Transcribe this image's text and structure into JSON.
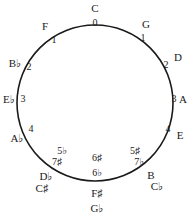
{
  "diagram": {
    "circle": {
      "cx": 95,
      "cy": 103,
      "r": 78,
      "stroke": "#1a1a1a",
      "stroke_width": 1.6
    },
    "keys": [
      {
        "id": "c",
        "label": "C",
        "x": 95,
        "y": 8
      },
      {
        "id": "g",
        "label": "G",
        "x": 146,
        "y": 24
      },
      {
        "id": "d",
        "label": "D",
        "x": 178,
        "y": 57
      },
      {
        "id": "a",
        "label": "A",
        "x": 183,
        "y": 99
      },
      {
        "id": "e",
        "label": "E",
        "x": 180,
        "y": 135
      },
      {
        "id": "b",
        "label": "B",
        "x": 151,
        "y": 175
      },
      {
        "id": "cb",
        "label": "C♭",
        "x": 157,
        "y": 186
      },
      {
        "id": "fs",
        "label": "F♯",
        "x": 97,
        "y": 193
      },
      {
        "id": "gb",
        "label": "G♭",
        "x": 97,
        "y": 208
      },
      {
        "id": "db",
        "label": "D♭",
        "x": 46,
        "y": 176
      },
      {
        "id": "cs",
        "label": "C♯",
        "x": 42,
        "y": 188
      },
      {
        "id": "ab",
        "label": "A♭",
        "x": 17,
        "y": 138
      },
      {
        "id": "eb",
        "label": "E♭",
        "x": 9,
        "y": 99
      },
      {
        "id": "bb",
        "label": "B♭",
        "x": 15,
        "y": 63
      },
      {
        "id": "f",
        "label": "F",
        "x": 45,
        "y": 26
      }
    ],
    "numbers": [
      {
        "id": "n-c",
        "label": "0",
        "x": 95,
        "y": 23
      },
      {
        "id": "n-g",
        "label": "1",
        "x": 143,
        "y": 38
      },
      {
        "id": "n-d",
        "label": "2",
        "x": 166,
        "y": 65
      },
      {
        "id": "n-a",
        "label": "3",
        "x": 174,
        "y": 99
      },
      {
        "id": "n-e",
        "label": "4",
        "x": 168,
        "y": 129
      },
      {
        "id": "n-b1",
        "label": "5♯",
        "x": 135,
        "y": 151
      },
      {
        "id": "n-b2",
        "label": "7♭",
        "x": 139,
        "y": 162
      },
      {
        "id": "n-fs1",
        "label": "6♯",
        "x": 97,
        "y": 158
      },
      {
        "id": "n-fs2",
        "label": "6♭",
        "x": 97,
        "y": 173
      },
      {
        "id": "n-db1",
        "label": "5♭",
        "x": 62,
        "y": 151
      },
      {
        "id": "n-db2",
        "label": "7♯",
        "x": 57,
        "y": 162
      },
      {
        "id": "n-ab",
        "label": "4",
        "x": 31,
        "y": 129
      },
      {
        "id": "n-eb",
        "label": "3",
        "x": 23,
        "y": 99
      },
      {
        "id": "n-bb",
        "label": "2",
        "x": 29,
        "y": 67
      },
      {
        "id": "n-f",
        "label": "1",
        "x": 54,
        "y": 40
      }
    ]
  }
}
